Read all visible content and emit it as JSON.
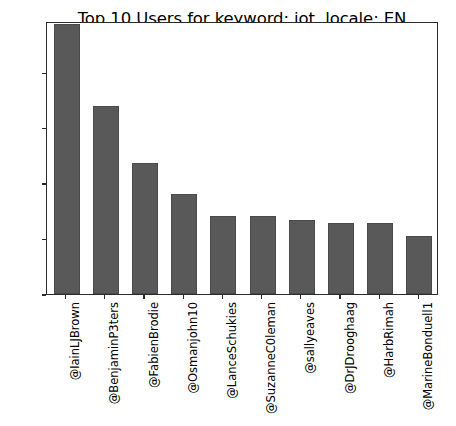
{
  "chart_data": {
    "type": "bar",
    "title": "Top 10 Users for keyword: iot, locale: EN",
    "xlabel": "",
    "ylabel": "",
    "categories": [
      "@IainLJBrown",
      "@BenjaminP3ters",
      "@FabienBrodie",
      "@Osmanjohn10",
      "@LanceSchukies",
      "@SuzanneC0leman",
      "@sallyeaves",
      "@DrJDrooghaag",
      "@HarbRimah",
      "@MarineBonduell1"
    ],
    "values": [
      975,
      680,
      473,
      360,
      282,
      281,
      268,
      258,
      255,
      211
    ],
    "ylim": [
      0,
      985
    ],
    "yticks": [
      0,
      200,
      400,
      600,
      800
    ],
    "ytick_labels": [
      "0",
      "200",
      "400",
      "600",
      "800"
    ],
    "grid": false,
    "legend": null,
    "bar_color": "#595959",
    "bar_edge_color": "#4a4a4a",
    "axis_color": "#2b2b2b",
    "background_color": "#ffffff"
  }
}
